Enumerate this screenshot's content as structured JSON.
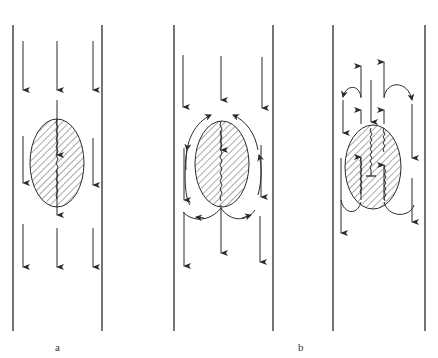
{
  "figure": {
    "labels": {
      "a": "a",
      "b": "b"
    },
    "colors": {
      "ink": "#2a2a2a",
      "background": "#ffffff"
    },
    "panels": [
      {
        "id": "panel-1",
        "description": "Uniform downward flow past a hatched elliptical body with a single central crack line"
      },
      {
        "id": "panel-2",
        "description": "Downward flow with circulating eddies around the hatched elliptical body"
      },
      {
        "id": "panel-3",
        "description": "Flow with upward jets and recirculation loops above/below the hatched body with multiple crack lines and a T-marker"
      }
    ]
  }
}
